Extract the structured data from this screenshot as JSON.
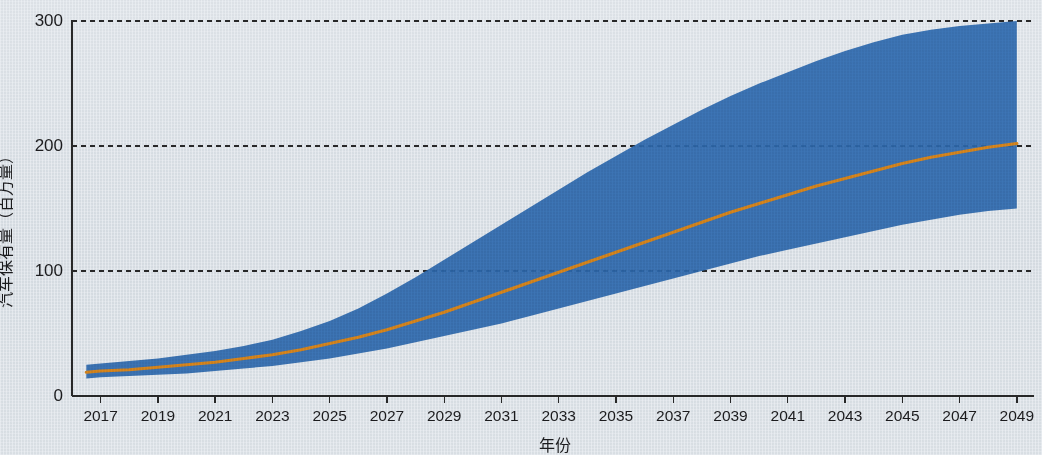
{
  "chart_data": {
    "type": "area",
    "title": "",
    "xlabel": "年份",
    "ylabel": "汽车保有量（百万量）",
    "xlim": [
      2016,
      2049.6
    ],
    "ylim": [
      0,
      300
    ],
    "grid": true,
    "grid_style": "dashed horizontal gridlines at y ticks",
    "legend": "none",
    "x_ticks": [
      2017,
      2019,
      2021,
      2023,
      2025,
      2027,
      2029,
      2031,
      2033,
      2035,
      2037,
      2039,
      2041,
      2043,
      2045,
      2047,
      2049
    ],
    "x_tick_labels": [
      "2017",
      "2019",
      "2021",
      "2023",
      "2025",
      "2027",
      "2029",
      "2031",
      "2033",
      "2035",
      "2037",
      "2039",
      "2041",
      "2043",
      "2045",
      "2047",
      "2049"
    ],
    "y_ticks": [
      0,
      100,
      200,
      300
    ],
    "y_tick_labels": [
      "0",
      "100",
      "200",
      "300"
    ],
    "colors": {
      "band": "#2f6cb2",
      "median_line": "#e08a1e",
      "axis": "#2a2a2a",
      "grid": "#2a2a2a",
      "background": "#eef1f4"
    },
    "x": [
      2016.5,
      2017,
      2018,
      2019,
      2020,
      2021,
      2022,
      2023,
      2024,
      2025,
      2026,
      2027,
      2028,
      2029,
      2030,
      2031,
      2032,
      2033,
      2034,
      2035,
      2036,
      2037,
      2038,
      2039,
      2040,
      2041,
      2042,
      2043,
      2044,
      2045,
      2046,
      2047,
      2048,
      2049
    ],
    "series": [
      {
        "name": "上界（高情景）",
        "role": "band_upper",
        "values": [
          25,
          26,
          28,
          30,
          33,
          36,
          40,
          45,
          52,
          60,
          70,
          82,
          95,
          109,
          123,
          137,
          151,
          165,
          179,
          192,
          205,
          217,
          229,
          240,
          250,
          259,
          268,
          276,
          283,
          289,
          293,
          296,
          298,
          300
        ]
      },
      {
        "name": "中位预测",
        "role": "median_line",
        "values": [
          19,
          20,
          21,
          23,
          25,
          27,
          30,
          33,
          37,
          42,
          47,
          53,
          60,
          67,
          75,
          83,
          91,
          99,
          107,
          115,
          123,
          131,
          139,
          147,
          154,
          161,
          168,
          174,
          180,
          186,
          191,
          195,
          199,
          202
        ]
      },
      {
        "name": "下界（低情景）",
        "role": "band_lower",
        "values": [
          14,
          15,
          16,
          17,
          18,
          20,
          22,
          24,
          27,
          30,
          34,
          38,
          43,
          48,
          53,
          58,
          64,
          70,
          76,
          82,
          88,
          94,
          100,
          106,
          112,
          117,
          122,
          127,
          132,
          137,
          141,
          145,
          148,
          150
        ]
      }
    ],
    "annotations": []
  }
}
